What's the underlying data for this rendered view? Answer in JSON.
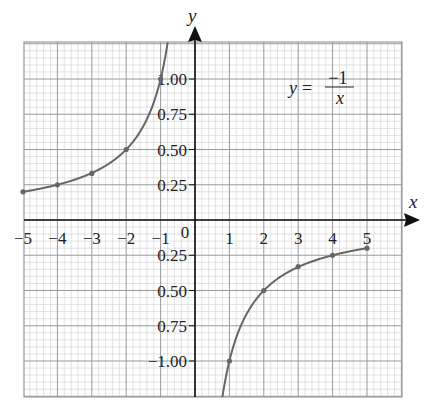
{
  "chart_data": {
    "type": "line",
    "title": "",
    "annotation": {
      "lhs": "y",
      "eq": "=",
      "numerator": "−1",
      "denominator": "x"
    },
    "xlabel": "x",
    "ylabel": "y",
    "xlim": [
      -5,
      6
    ],
    "ylim": [
      -1.25,
      1.25
    ],
    "grid": true,
    "legend": null,
    "x_ticks": [
      "−5",
      "−4",
      "−3",
      "−2",
      "−1",
      "0",
      "1",
      "2",
      "3",
      "4",
      "5"
    ],
    "y_ticks_positive": [
      "0.25",
      "0.50",
      "0.75",
      "1.00"
    ],
    "y_ticks_negative": [
      "0.25",
      "0.50",
      "0.75",
      "−1.00"
    ],
    "series": [
      {
        "name": "y = -1/x (x < 0)",
        "points": [
          [
            -5,
            0.2
          ],
          [
            -4,
            0.25
          ],
          [
            -3,
            0.33
          ],
          [
            -2,
            0.5
          ],
          [
            -1,
            1.0
          ]
        ]
      },
      {
        "name": "y = -1/x (x > 0)",
        "points": [
          [
            1,
            -1.0
          ],
          [
            2,
            -0.5
          ],
          [
            3,
            -0.33
          ],
          [
            4,
            -0.25
          ],
          [
            5,
            -0.2
          ]
        ]
      }
    ],
    "colors": {
      "curve": "#666666",
      "grid_major": "#9a9a9a",
      "grid_minor": "#cfcfcf",
      "axis": "#111111"
    }
  }
}
